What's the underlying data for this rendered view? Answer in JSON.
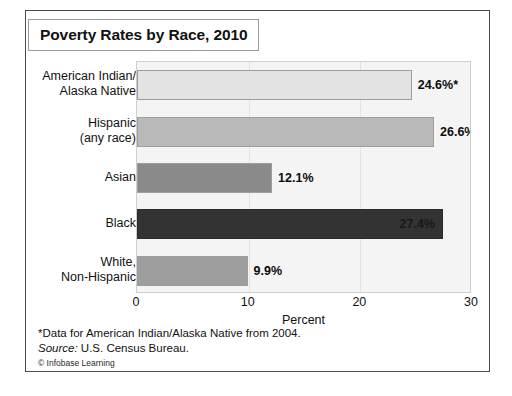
{
  "figure": {
    "title": "Poverty Rates by Race, 2010"
  },
  "chart_data": {
    "type": "bar",
    "orientation": "horizontal",
    "title": "Poverty Rates by Race, 2010",
    "xlabel": "Percent",
    "ylabel": "",
    "xlim": [
      0,
      30
    ],
    "xticks": [
      0,
      10,
      20,
      30
    ],
    "xtick_labels": [
      "0",
      "10",
      "20",
      "30"
    ],
    "grid": "vertical-light",
    "legend": "none",
    "categories": [
      "American Indian/\nAlaska Native",
      "Hispanic\n(any race)",
      "Asian",
      "Black",
      "White,\nNon-Hispanic"
    ],
    "values": [
      24.6,
      26.6,
      12.1,
      27.4,
      9.9
    ],
    "value_labels": [
      "24.6%*",
      "26.6%",
      "12.1%",
      "27.4%",
      "9.9%"
    ],
    "bar_colors": [
      "#e3e3e3",
      "#b9b9b9",
      "#8a8a8a",
      "#333333",
      "#9e9e9e"
    ],
    "label_placement": [
      "outside",
      "outside",
      "outside",
      "inside",
      "outside"
    ],
    "annotations": [
      "*Data for American Indian/Alaska Native from 2004."
    ]
  },
  "categories": [
    {
      "line1": "American Indian/",
      "line2": "Alaska Native"
    },
    {
      "line1": "Hispanic",
      "line2": "(any race)"
    },
    {
      "line1": "Asian",
      "line2": ""
    },
    {
      "line1": "Black",
      "line2": ""
    },
    {
      "line1": "White,",
      "line2": "Non-Hispanic"
    }
  ],
  "axis": {
    "title": "Percent",
    "ticks": [
      "0",
      "10",
      "20",
      "30"
    ]
  },
  "footnotes": {
    "star_note": "*Data for American Indian/Alaska Native from 2004.",
    "source_label": "Source:",
    "source_value": "U.S. Census Bureau.",
    "credit": "© Infobase Learning"
  }
}
